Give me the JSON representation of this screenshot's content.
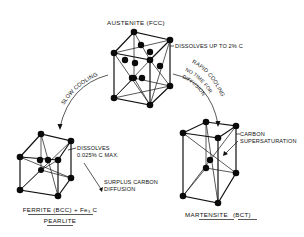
{
  "diagram": {
    "austenite": {
      "title": "AUSTENITE (FCC)",
      "note": "DISSOLVES UP TO 2% C"
    },
    "slow_cooling": {
      "label": "SLOW COOLING"
    },
    "rapid_cooling": {
      "label_line1": "RAPID COOLING",
      "label_line2": "NO TIME FOR",
      "label_line3": "DIFFUSION"
    },
    "ferrite": {
      "note_line1": "DISSOLVES",
      "note_line2": "0.025% C MAX.",
      "surplus_line1": "SURPLUS CARBON",
      "surplus_line2": "DIFFUSION",
      "title": "FERRITE (BCC) + Fe₃ C",
      "subtitle": "PEARLITE"
    },
    "martensite": {
      "note_line1": "CARBON",
      "note_line2": "SUPERSATURATION",
      "title": "MARTENSITE",
      "title_suffix": "(BCT)"
    },
    "colors": {
      "ink": "#111111",
      "background": "#ffffff"
    }
  }
}
